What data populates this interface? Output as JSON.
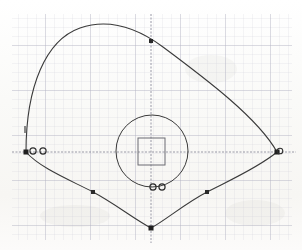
{
  "figure": {
    "kind": "scanned-graph-paper-diagram",
    "background_color": "#fdfdfc",
    "ink_color": "#3a3a3a",
    "grid_minor_color": "#c9c9d6",
    "grid_major_color": "#a8a8bb",
    "axis_color": "#8e8e9e"
  },
  "grid": {
    "origin_x": 12,
    "origin_y": 14,
    "end_x": 292,
    "end_y": 240,
    "minor_spacing": 9,
    "major_every": 5,
    "major_spacing": 45,
    "visible": true
  },
  "axes": {
    "x_axis_y": 152,
    "y_axis_x": 151,
    "x_axis_label": "",
    "y_axis_label": "",
    "visible": true
  },
  "chart_data": {
    "type": "line",
    "xlabel": "",
    "ylabel": "",
    "grid": true,
    "legend": "none",
    "xlim": [
      12,
      292
    ],
    "ylim": [
      14,
      240
    ],
    "series": [
      {
        "name": "outer-closed-curve",
        "closed": true,
        "stroke": "#3a3a3a",
        "stroke_width": 1.1,
        "path": "M 26 152 C 26 86 46 40 80 28 C 112 17 140 30 163 47 C 206 79 258 118 277 152 C 258 168 226 182 207 192 C 184 204 166 220 151 228 C 134 219 114 203 93 192 C 70 180 40 168 26 152 Z",
        "vertices": [
          {
            "name": "left-vertex",
            "x": 26,
            "y": 152
          },
          {
            "name": "right-vertex",
            "x": 277,
            "y": 152
          },
          {
            "name": "bottom-vertex",
            "x": 151,
            "y": 228
          }
        ],
        "apex": {
          "x": 95,
          "y": 27
        }
      },
      {
        "name": "inner-circle",
        "closed": true,
        "stroke": "#3a3a3a",
        "stroke_width": 1.0,
        "center_x": 152,
        "center_y": 151,
        "radius": 36
      },
      {
        "name": "inner-square",
        "closed": true,
        "stroke": "#6b6b72",
        "stroke_width": 1.0,
        "x": 138,
        "y": 138,
        "width": 27,
        "height": 27
      }
    ],
    "markers": [
      {
        "name": "marker-top",
        "shape": "square",
        "x": 151,
        "y": 41,
        "size": 4,
        "fill": "#2a2a2a"
      },
      {
        "name": "marker-left-vertex",
        "shape": "square",
        "x": 26,
        "y": 152,
        "size": 5,
        "fill": "#1f1f1f"
      },
      {
        "name": "marker-right-vertex",
        "shape": "square",
        "x": 277,
        "y": 152,
        "size": 5,
        "fill": "#1f1f1f"
      },
      {
        "name": "marker-bottom-vertex",
        "shape": "square",
        "x": 151,
        "y": 228,
        "size": 5,
        "fill": "#1f1f1f"
      },
      {
        "name": "marker-lower-left",
        "shape": "square",
        "x": 93,
        "y": 192,
        "size": 4,
        "fill": "#2a2a2a"
      },
      {
        "name": "marker-lower-right",
        "shape": "square",
        "x": 207,
        "y": 192,
        "size": 4,
        "fill": "#2a2a2a"
      }
    ],
    "small_circles": [
      {
        "name": "ring-left-a",
        "x": 33,
        "y": 151,
        "r": 3.1
      },
      {
        "name": "ring-left-b",
        "x": 43,
        "y": 151,
        "r": 3.1
      },
      {
        "name": "ring-bottom-a",
        "x": 153,
        "y": 187,
        "r": 3.1
      },
      {
        "name": "ring-bottom-b",
        "x": 162,
        "y": 187,
        "r": 3.1
      },
      {
        "name": "ring-right",
        "x": 280,
        "y": 151,
        "r": 2.8
      }
    ],
    "tick_marks": [
      {
        "name": "tick-left-curve",
        "x1": 25,
        "y1": 126,
        "x2": 25,
        "y2": 133
      }
    ]
  },
  "annotations": {
    "text_items": []
  }
}
